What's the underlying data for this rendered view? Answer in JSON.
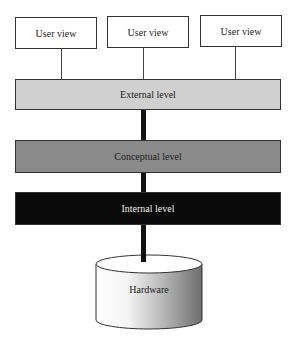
{
  "diagram": {
    "user_views": [
      {
        "label": "User view"
      },
      {
        "label": "User view"
      },
      {
        "label": "User view"
      }
    ],
    "levels": {
      "external": {
        "label": "External level",
        "color": "#d0d0d0"
      },
      "conceptual": {
        "label": "Conceptual level",
        "color": "#8a8a8a"
      },
      "internal": {
        "label": "Internal level",
        "color": "#0a0a0a"
      }
    },
    "storage": {
      "label": "Hardware"
    }
  }
}
